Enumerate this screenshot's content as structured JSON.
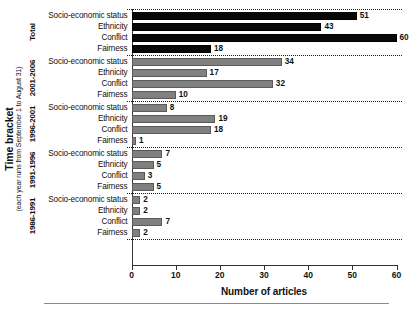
{
  "chart_data": {
    "type": "bar",
    "orientation": "horizontal",
    "title": "",
    "xlabel": "Number of articles",
    "ylabel": "Time bracket",
    "ylabel_sub": "(each year runs from September 1 to August 31)",
    "xlim": [
      0,
      60
    ],
    "xticks": [
      0,
      10,
      20,
      30,
      40,
      50,
      60
    ],
    "xtick_labels": [
      "0",
      "10",
      "20",
      "30",
      "40",
      "50",
      "60"
    ],
    "grid": false,
    "legend": "none",
    "categories": [
      "Socio-economic status",
      "Ethnicity",
      "Conflict",
      "Fairness"
    ],
    "groups": [
      {
        "name": "Total",
        "color": "#080808",
        "values": [
          51,
          43,
          60,
          18
        ],
        "bars": [
          {
            "label": "Socio-economic status",
            "value": 51,
            "value_text": "51"
          },
          {
            "label": "Ethnicity",
            "value": 43,
            "value_text": "43"
          },
          {
            "label": "Conflict",
            "value": 60,
            "value_text": "60"
          },
          {
            "label": "Fairness",
            "value": 18,
            "value_text": "18"
          }
        ]
      },
      {
        "name": "2001-2006",
        "color": "#808080",
        "values": [
          34,
          17,
          32,
          10
        ],
        "bars": [
          {
            "label": "Socio-economic status",
            "value": 34,
            "value_text": "34"
          },
          {
            "label": "Ethnicity",
            "value": 17,
            "value_text": "17"
          },
          {
            "label": "Conflict",
            "value": 32,
            "value_text": "32"
          },
          {
            "label": "Fairness",
            "value": 10,
            "value_text": "10"
          }
        ]
      },
      {
        "name": "1996-2001",
        "color": "#808080",
        "values": [
          8,
          19,
          18,
          1
        ],
        "bars": [
          {
            "label": "Socio-economic status",
            "value": 8,
            "value_text": "8"
          },
          {
            "label": "Ethnicity",
            "value": 19,
            "value_text": "19"
          },
          {
            "label": "Conflict",
            "value": 18,
            "value_text": "18"
          },
          {
            "label": "Fairness",
            "value": 1,
            "value_text": "1"
          }
        ]
      },
      {
        "name": "1991-1996",
        "color": "#808080",
        "values": [
          7,
          5,
          3,
          5
        ],
        "bars": [
          {
            "label": "Socio-economic status",
            "value": 7,
            "value_text": "7"
          },
          {
            "label": "Ethnicity",
            "value": 5,
            "value_text": "5"
          },
          {
            "label": "Conflict",
            "value": 3,
            "value_text": "3"
          },
          {
            "label": "Fairness",
            "value": 5,
            "value_text": "5"
          }
        ]
      },
      {
        "name": "1986-1991",
        "color": "#808080",
        "values": [
          2,
          2,
          7,
          2
        ],
        "bars": [
          {
            "label": "Socio-economic status",
            "value": 2,
            "value_text": "2"
          },
          {
            "label": "Ethnicity",
            "value": 2,
            "value_text": "2"
          },
          {
            "label": "Conflict",
            "value": 7,
            "value_text": "7"
          },
          {
            "label": "Fairness",
            "value": 2,
            "value_text": "2"
          }
        ]
      }
    ]
  }
}
